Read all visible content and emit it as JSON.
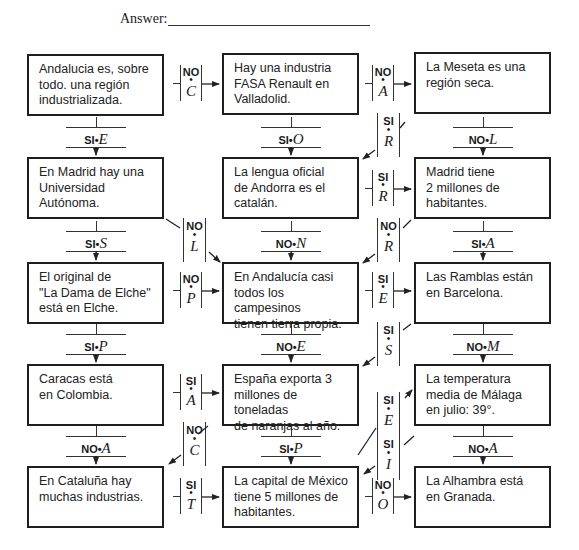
{
  "header": {
    "answer_label": "Answer:"
  },
  "boxes": [
    {
      "id": 1,
      "text": "Andalucia es, sobre\ntodo. una región\nindustrializada."
    },
    {
      "id": 2,
      "text": "Hay una industria\nFASA Renault en\nValladolid."
    },
    {
      "id": 3,
      "text": "La Meseta es una\nregión seca."
    },
    {
      "id": 4,
      "text": "En Madrid hay una\nUniversidad\nAutónoma."
    },
    {
      "id": 5,
      "text": "La lengua oficial\nde Andorra es el\ncatalán."
    },
    {
      "id": 6,
      "text": "Madrid tiene\n2 millones de\nhabitantes."
    },
    {
      "id": 7,
      "text": "El original de\n\"La Dama de Elche\"\nestá en Elche."
    },
    {
      "id": 8,
      "text": "En Andalucía casi\ntodos los campesinos\ntienen tierra propia."
    },
    {
      "id": 9,
      "text": "Las Ramblas están\nen Barcelona."
    },
    {
      "id": 10,
      "text": "Caracas está\nen Colombia."
    },
    {
      "id": 11,
      "text": "España exporta 3\nmillones de toneladas\nde naranjas al año."
    },
    {
      "id": 12,
      "text": "La temperatura\nmedia de Málaga\nen julio: 39°."
    },
    {
      "id": 13,
      "text": "En Cataluña hay\nmuchas industrias."
    },
    {
      "id": 14,
      "text": "La capital de México\ntiene 5 millones de\nhabitantes."
    },
    {
      "id": 15,
      "text": "La Alhambra está\nen Granada."
    }
  ],
  "horizontal_connectors": [
    {
      "from": 1,
      "to": 2,
      "answer": "NO",
      "letter": "C"
    },
    {
      "from": 2,
      "to": 3,
      "answer": "NO",
      "letter": "A"
    },
    {
      "from": 5,
      "to": 6,
      "answer": "SI",
      "letter": "R"
    },
    {
      "from": 7,
      "to": 8,
      "answer": "NO",
      "letter": "P"
    },
    {
      "from": 8,
      "to": 9,
      "answer": "SI",
      "letter": "E"
    },
    {
      "from": 10,
      "to": 11,
      "answer": "SI",
      "letter": "A"
    },
    {
      "from": 13,
      "to": 14,
      "answer": "SI",
      "letter": "T"
    },
    {
      "from": 14,
      "to": 15,
      "answer": "NO",
      "letter": "O"
    }
  ],
  "vertical_connectors": [
    {
      "from": 1,
      "to": 4,
      "answer": "SI",
      "letter": "E"
    },
    {
      "from": 2,
      "to": 5,
      "answer": "SI",
      "letter": "O"
    },
    {
      "from": 3,
      "to": 6,
      "answer": "NO",
      "letter": "L"
    },
    {
      "from": 4,
      "to": 7,
      "answer": "SI",
      "letter": "S"
    },
    {
      "from": 5,
      "to": 8,
      "answer": "NO",
      "letter": "N"
    },
    {
      "from": 6,
      "to": 9,
      "answer": "SI",
      "letter": "A"
    },
    {
      "from": 7,
      "to": 10,
      "answer": "SI",
      "letter": "P"
    },
    {
      "from": 8,
      "to": 11,
      "answer": "NO",
      "letter": "E"
    },
    {
      "from": 9,
      "to": 12,
      "answer": "NO",
      "letter": "M"
    },
    {
      "from": 10,
      "to": 13,
      "answer": "NO",
      "letter": "A"
    },
    {
      "from": 11,
      "to": 14,
      "answer": "SI",
      "letter": "P"
    },
    {
      "from": 12,
      "to": 15,
      "answer": "NO",
      "letter": "A"
    }
  ],
  "diagonal_connectors": [
    {
      "from": 3,
      "to": 5,
      "answer": "SI",
      "letter": "R"
    },
    {
      "from": 4,
      "to": 8,
      "answer": "NO",
      "letter": "L"
    },
    {
      "from": 6,
      "to": 8,
      "answer": "NO",
      "letter": "R"
    },
    {
      "from": 9,
      "to": 11,
      "answer": "SI",
      "letter": "S"
    },
    {
      "from": 14,
      "to": 12,
      "answer": "SI",
      "letter": "E"
    },
    {
      "from": 11,
      "to": 13,
      "answer": "NO",
      "letter": "C"
    },
    {
      "from": 12,
      "to": 14,
      "answer": "SI",
      "letter": "I"
    }
  ]
}
